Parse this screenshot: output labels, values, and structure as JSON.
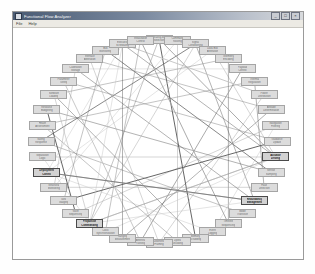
{
  "window": {
    "title": "Functional Flow Analyzer",
    "icon": "app-icon",
    "buttons": [
      {
        "name": "minimize-button",
        "glyph": "_"
      },
      {
        "name": "maximize-button",
        "glyph": "□"
      },
      {
        "name": "close-button",
        "glyph": "×"
      }
    ]
  },
  "menu": {
    "items": [
      {
        "name": "menu-file",
        "label": "File"
      },
      {
        "name": "menu-help",
        "label": "Help"
      }
    ]
  },
  "graph": {
    "layout": "circular",
    "center": {
      "x": 146,
      "y": 112
    },
    "radius_x": 118,
    "radius_y": 102,
    "node_fill": "#dcdcdc",
    "node_border": "#a5a5a5",
    "highlight_text": "#111111",
    "edge_colors": [
      "#555555",
      "#7a7a7a",
      "#a0a0a0",
      "#c2c2c2"
    ],
    "nodes": [
      {
        "label": "Operating Mode",
        "label2": "Selection",
        "highlight": false
      },
      {
        "label": "Command",
        "label2": "Routing",
        "highlight": false
      },
      {
        "label": "Signal",
        "label2": "Conditioning",
        "highlight": false
      },
      {
        "label": "Data Bus",
        "label2": "Arbitration",
        "highlight": false
      },
      {
        "label": "Telemetry",
        "label2": "Encoding",
        "highlight": false
      },
      {
        "label": "Payload",
        "label2": "Control",
        "highlight": false
      },
      {
        "label": "Thermal",
        "label2": "Regulation",
        "highlight": false
      },
      {
        "label": "Power",
        "label2": "Distribution",
        "highlight": false
      },
      {
        "label": "Attitude",
        "label2": "Determination",
        "highlight": false
      },
      {
        "label": "Navigation",
        "label2": "Filtering",
        "highlight": false
      },
      {
        "label": "Guidance",
        "label2": "Update",
        "highlight": false
      },
      {
        "label": "Actuator",
        "label2": "Driving",
        "highlight": true
      },
      {
        "label": "Sensor",
        "label2": "Sampling",
        "highlight": false
      },
      {
        "label": "Fault",
        "label2": "Detection",
        "highlight": false
      },
      {
        "label": "Redundancy",
        "label2": "Management",
        "highlight": true
      },
      {
        "label": "Mode",
        "label2": "Transition",
        "highlight": false
      },
      {
        "label": "Timeline",
        "label2": "Sequencing",
        "highlight": false
      },
      {
        "label": "Event",
        "label2": "Logging",
        "highlight": false
      },
      {
        "label": "Memory",
        "label2": "Scrubbing",
        "highlight": false
      },
      {
        "label": "Uplink",
        "label2": "Decoding",
        "highlight": false
      },
      {
        "label": "Downlink",
        "label2": "Framing",
        "highlight": false
      },
      {
        "label": "Antenna",
        "label2": "Pointing",
        "highlight": false
      },
      {
        "label": "Ranging",
        "label2": "Measurement",
        "highlight": false
      },
      {
        "label": "Clock",
        "label2": "Synchronization",
        "highlight": false
      },
      {
        "label": "Propulsion",
        "label2": "Commanding",
        "highlight": true
      },
      {
        "label": "Valve",
        "label2": "Sequencing",
        "highlight": false
      },
      {
        "label": "Tank",
        "label2": "Gauging",
        "highlight": false
      },
      {
        "label": "Structural",
        "label2": "Monitoring",
        "highlight": false
      },
      {
        "label": "Deployment",
        "label2": "Control",
        "highlight": true
      },
      {
        "label": "Separation",
        "label2": "Logic",
        "highlight": false
      },
      {
        "label": "Safing",
        "label2": "Response",
        "highlight": false
      },
      {
        "label": "Health",
        "label2": "Assessment",
        "highlight": false
      },
      {
        "label": "Resource",
        "label2": "Budgeting",
        "highlight": false
      },
      {
        "label": "Software",
        "label2": "Loading",
        "highlight": false
      },
      {
        "label": "Parameter",
        "label2": "Tuning",
        "highlight": false
      },
      {
        "label": "Calibration",
        "label2": "Storage",
        "highlight": false
      },
      {
        "label": "Interface",
        "label2": "Arbitration",
        "highlight": false
      },
      {
        "label": "Bus",
        "label2": "Monitoring",
        "highlight": false
      },
      {
        "label": "Executive",
        "label2": "Scheduling",
        "highlight": false
      },
      {
        "label": "Initialization",
        "label2": "Control",
        "highlight": false
      }
    ],
    "edges": [
      [
        0,
        18
      ],
      [
        0,
        24
      ],
      [
        1,
        19
      ],
      [
        1,
        27
      ],
      [
        2,
        14
      ],
      [
        2,
        30
      ],
      [
        3,
        11
      ],
      [
        3,
        28
      ],
      [
        4,
        16
      ],
      [
        4,
        33
      ],
      [
        5,
        21
      ],
      [
        5,
        35
      ],
      [
        6,
        13
      ],
      [
        6,
        31
      ],
      [
        7,
        20
      ],
      [
        7,
        38
      ],
      [
        8,
        22
      ],
      [
        8,
        36
      ],
      [
        9,
        25
      ],
      [
        9,
        17
      ],
      [
        10,
        26
      ],
      [
        10,
        34
      ],
      [
        11,
        29
      ],
      [
        11,
        23
      ],
      [
        12,
        32
      ],
      [
        12,
        37
      ],
      [
        13,
        27
      ],
      [
        14,
        24
      ],
      [
        14,
        35
      ],
      [
        15,
        30
      ],
      [
        16,
        39
      ],
      [
        17,
        28
      ],
      [
        18,
        33
      ],
      [
        19,
        31
      ],
      [
        20,
        36
      ],
      [
        21,
        34
      ],
      [
        22,
        38
      ],
      [
        23,
        39
      ],
      [
        24,
        33
      ],
      [
        24,
        29
      ],
      [
        25,
        32
      ],
      [
        26,
        37
      ],
      [
        27,
        35
      ],
      [
        28,
        38
      ],
      [
        11,
        24
      ],
      [
        14,
        28
      ],
      [
        2,
        24
      ],
      [
        24,
        38
      ],
      [
        11,
        38
      ],
      [
        28,
        14
      ],
      [
        0,
        11
      ],
      [
        24,
        11
      ]
    ]
  }
}
